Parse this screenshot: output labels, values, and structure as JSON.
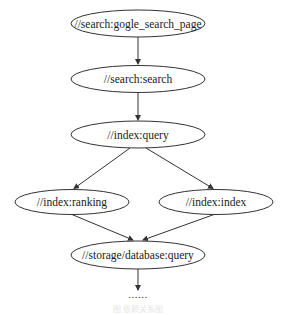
{
  "diagram": {
    "type": "dependency-graph",
    "nodes": [
      {
        "id": "n0",
        "label": "//search:gogle_search_page",
        "cx": 138,
        "cy": 23.5,
        "rx": 67,
        "ry": 13.5
      },
      {
        "id": "n1",
        "label": "//search:search",
        "cx": 138,
        "cy": 79,
        "rx": 67,
        "ry": 13.5
      },
      {
        "id": "n2",
        "label": "//index:query",
        "cx": 138,
        "cy": 134.5,
        "rx": 67,
        "ry": 13.5
      },
      {
        "id": "n3",
        "label": "//index:ranking",
        "cx": 72,
        "cy": 202,
        "rx": 57,
        "ry": 12.5
      },
      {
        "id": "n4",
        "label": "//index:index",
        "cx": 216,
        "cy": 202,
        "rx": 57,
        "ry": 12.5
      },
      {
        "id": "n5",
        "label": "//storage/database:query",
        "cx": 138,
        "cy": 255,
        "rx": 67,
        "ry": 14
      }
    ],
    "edges": [
      {
        "from": "n0",
        "to": "n1"
      },
      {
        "from": "n1",
        "to": "n2"
      },
      {
        "from": "n2",
        "to": "n3"
      },
      {
        "from": "n2",
        "to": "n4"
      },
      {
        "from": "n3",
        "to": "n5"
      },
      {
        "from": "n4",
        "to": "n5"
      },
      {
        "from": "n5",
        "to": "ellipsis"
      }
    ],
    "ellipsis": "......",
    "caption": "图 依赖关系图"
  }
}
